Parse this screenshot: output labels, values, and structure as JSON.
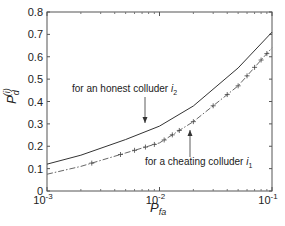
{
  "chart_data": {
    "type": "line",
    "title": "",
    "xlabel": "P_fa",
    "ylabel": "P_d^(i)",
    "xscale": "log",
    "xlim": [
      0.001,
      0.1
    ],
    "ylim": [
      0,
      0.8
    ],
    "x_ticks": [
      "10^-3",
      "10^-2",
      "10^-1"
    ],
    "y_ticks": [
      "0",
      "0.1",
      "0.2",
      "0.3",
      "0.4",
      "0.5",
      "0.6",
      "0.7",
      "0.8"
    ],
    "grid": false,
    "legend": "none (inline annotations with arrows)",
    "x": [
      0.001,
      0.002,
      0.005,
      0.01,
      0.02,
      0.05,
      0.1
    ],
    "series": [
      {
        "name": "for an honest colluder i2",
        "style": "solid",
        "values": [
          0.12,
          0.16,
          0.23,
          0.29,
          0.38,
          0.55,
          0.71
        ]
      },
      {
        "name": "for a cheating colluder i1",
        "style": "dash-dot with + markers",
        "values": [
          0.075,
          0.11,
          0.17,
          0.215,
          0.31,
          0.47,
          0.64
        ]
      }
    ],
    "annotations": [
      {
        "text": "for an honest colluder i",
        "sub": "2",
        "target_series": 0
      },
      {
        "text": "for a cheating colluder i",
        "sub": "1",
        "target_series": 1
      }
    ]
  },
  "labels": {
    "x_main": "P",
    "x_sub": "fa",
    "y_main": "P",
    "y_sub": "d",
    "y_sup": "(i)",
    "x_tick_base": "10",
    "x_tick_exps": [
      "-3",
      "-2",
      "-1"
    ],
    "annot_honest": "for an honest colluder ",
    "annot_honest_var": "i",
    "annot_honest_sub": "2",
    "annot_cheat": "for a cheating colluder ",
    "annot_cheat_var": "i",
    "annot_cheat_sub": "1"
  }
}
